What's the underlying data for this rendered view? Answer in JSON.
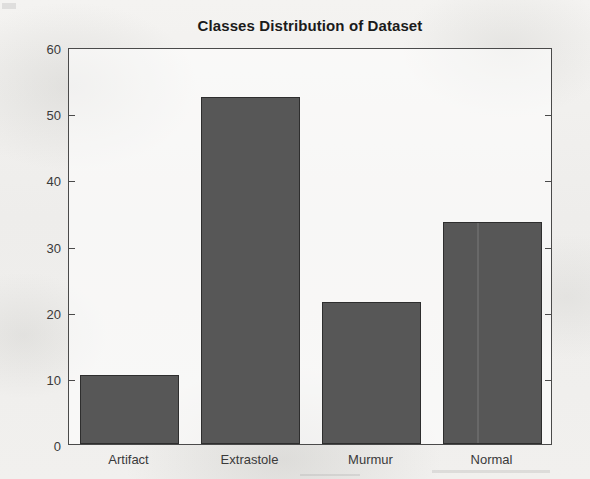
{
  "chart_data": {
    "type": "bar",
    "title": "Classes Distribution of Dataset",
    "xlabel": "",
    "ylabel": "",
    "categories": [
      "Artifact",
      "Extrastole",
      "Murmur",
      "Normal"
    ],
    "values": [
      10.5,
      52.5,
      21.5,
      33.5
    ],
    "ylim": [
      0,
      60
    ],
    "ytick_labels": [
      "0",
      "10",
      "20",
      "30",
      "40",
      "50",
      "60"
    ],
    "ytick_values": [
      0,
      10,
      20,
      30,
      40,
      50,
      60
    ],
    "ytick_step": 10,
    "grid": false,
    "legend": false,
    "legend_position": "none",
    "bar_color": "#575757",
    "bar_edge_color": "#2e2e2e",
    "axes_color": "#4a4a4a",
    "background_color": "#f2f1ef",
    "plot_background_color": "#fbfbfa",
    "title_color": "#1b1b1b",
    "tick_label_color": "#3a3a3a"
  }
}
